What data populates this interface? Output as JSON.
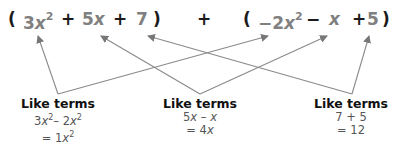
{
  "expression": {
    "open_paren_1": "(",
    "term_3x2": {
      "coef": "3",
      "var": "x",
      "exp": "2"
    },
    "plus_1": "+",
    "term_5x": {
      "coef": "5",
      "var": "x"
    },
    "plus_2": "+",
    "term_7": "7",
    "close_paren_1": ")",
    "plus_middle": "+",
    "open_paren_2": "(",
    "term_neg2x2": {
      "coef": "−2",
      "var": "x",
      "exp": "2"
    },
    "minus": "−",
    "term_x": {
      "var": "x"
    },
    "plus_3": "+",
    "term_5": "5",
    "close_paren_2": ")"
  },
  "groups": [
    {
      "title": "Like terms",
      "line1": {
        "a": "3",
        "ax": "x",
        "aexp": "2",
        "op": "– 2",
        "bx": "x",
        "bexp": "2"
      },
      "line2": {
        "prefix": "= 1",
        "x": "x",
        "exp": "2"
      }
    },
    {
      "title": "Like terms",
      "line1": {
        "a": "5",
        "ax": "x",
        "op": " – ",
        "bx": "x"
      },
      "line2": {
        "prefix": "= 4",
        "x": "x"
      }
    },
    {
      "title": "Like terms",
      "line1": "7 + 5",
      "line2": "= 12"
    }
  ],
  "colors": {
    "term": "#808080",
    "arrow": "#8a8a8a",
    "text": "#111111"
  }
}
